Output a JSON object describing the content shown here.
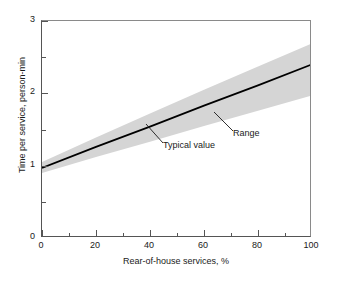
{
  "chart_data": {
    "type": "line",
    "title": "",
    "xlabel": "Rear-of-house services, %",
    "ylabel": "Time per service, person-min",
    "xlim": [
      0,
      100
    ],
    "ylim": [
      0,
      3
    ],
    "xticks": [
      0,
      20,
      40,
      60,
      80,
      100
    ],
    "xtick_labels": [
      "0",
      "20",
      "40",
      "60",
      "80",
      "100"
    ],
    "xminor_ticks": [
      10,
      30,
      50,
      70,
      90
    ],
    "yticks": [
      0,
      1,
      2,
      3
    ],
    "ytick_labels": [
      "0",
      "1",
      "2",
      "3"
    ],
    "yminor_ticks": [
      0.5,
      1.5,
      2.5
    ],
    "grid": false,
    "legend": "none",
    "series": [
      {
        "name": "Typical value",
        "style": "solid-line",
        "color": "#000000",
        "x": [
          0,
          20,
          40,
          60,
          80,
          100
        ],
        "values": [
          0.97,
          1.26,
          1.54,
          1.83,
          2.11,
          2.4
        ]
      },
      {
        "name": "Range",
        "style": "shaded-band",
        "color": "#d5d5d5",
        "x": [
          0,
          20,
          40,
          60,
          80,
          100
        ],
        "upper": [
          1.05,
          1.39,
          1.72,
          2.05,
          2.37,
          2.69
        ],
        "lower": [
          0.9,
          1.12,
          1.33,
          1.55,
          1.76,
          1.97
        ]
      }
    ],
    "annotations": [
      {
        "id": "range",
        "text": "Range",
        "label_x": 233,
        "label_y": 128,
        "leader_from": [
          232,
          130
        ],
        "leader_to": [
          213,
          111
        ]
      },
      {
        "id": "typical",
        "text": "Typical value",
        "label_x": 163,
        "label_y": 140,
        "leader_from": [
          162,
          142
        ],
        "leader_to": [
          145,
          123
        ]
      }
    ]
  },
  "axes": {
    "x": {
      "label": "Rear-of-house services, %",
      "ticks": [
        {
          "value": 0,
          "label": "0"
        },
        {
          "value": 20,
          "label": "20"
        },
        {
          "value": 40,
          "label": "40"
        },
        {
          "value": 60,
          "label": "60"
        },
        {
          "value": 80,
          "label": "80"
        },
        {
          "value": 100,
          "label": "100"
        }
      ],
      "minor_ticks": [
        10,
        30,
        50,
        70,
        90
      ]
    },
    "y": {
      "label": "Time per service, person-min",
      "ticks": [
        {
          "value": 0,
          "label": "0"
        },
        {
          "value": 1,
          "label": "1"
        },
        {
          "value": 2,
          "label": "2"
        },
        {
          "value": 3,
          "label": "3"
        }
      ],
      "minor_ticks": [
        0.5,
        1.5,
        2.5
      ]
    }
  },
  "annotations": {
    "range_label": "Range",
    "typical_label": "Typical value"
  },
  "colors": {
    "band_fill": "#d5d5d5",
    "line": "#000000",
    "axis": "#555555",
    "frame_light": "#8a8a8a",
    "background": "#ffffff",
    "text": "#1a1a1a"
  }
}
